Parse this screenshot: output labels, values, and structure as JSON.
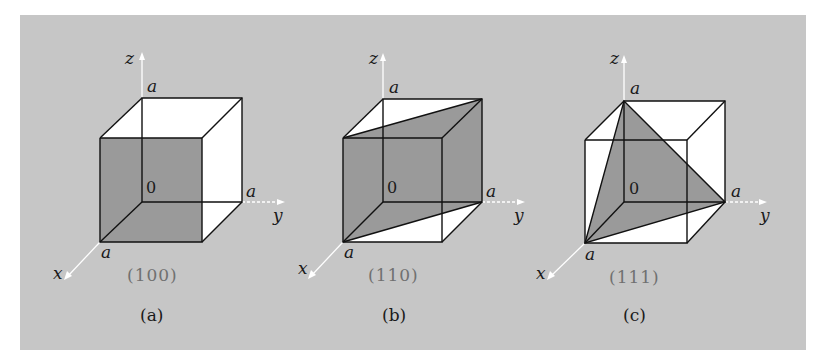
{
  "figure": {
    "background_color": "#c6c6c6",
    "plane_color": "#9a9a9a",
    "face_color": "#ffffff",
    "panels": [
      {
        "id": "a",
        "miller_index": "(100)",
        "caption": "(a)",
        "axis_x": "x",
        "axis_y": "y",
        "axis_z": "z",
        "origin": "0",
        "length_x": "a",
        "length_y": "a",
        "length_z": "a"
      },
      {
        "id": "b",
        "miller_index": "(110)",
        "caption": "(b)",
        "axis_x": "x",
        "axis_y": "y",
        "axis_z": "z",
        "origin": "0",
        "length_x": "a",
        "length_y": "a",
        "length_z": "a"
      },
      {
        "id": "c",
        "miller_index": "(111)",
        "caption": "(c)",
        "axis_x": "x",
        "axis_y": "y",
        "axis_z": "z",
        "origin": "0",
        "length_x": "a",
        "length_y": "a",
        "length_z": "a"
      }
    ]
  }
}
